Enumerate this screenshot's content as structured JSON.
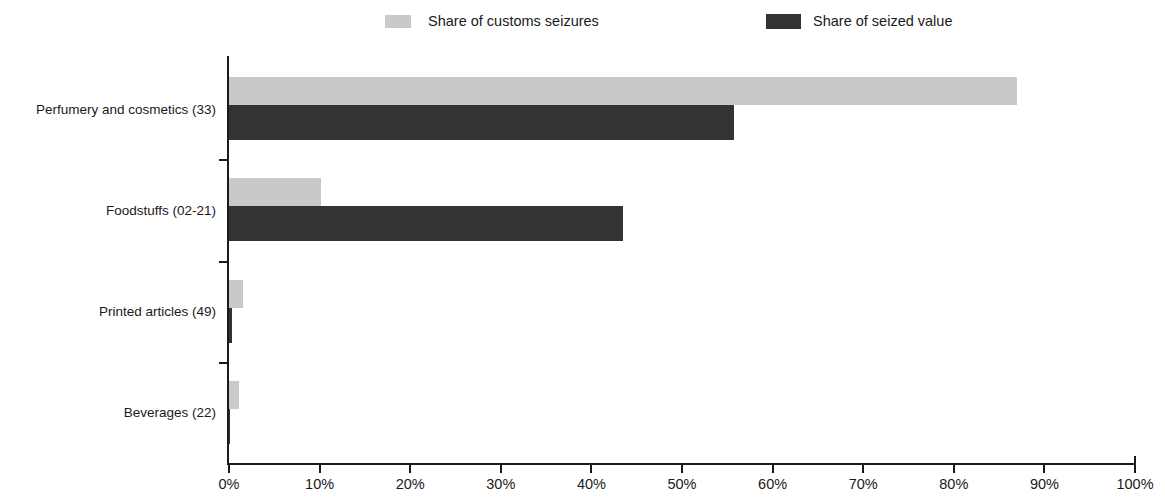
{
  "legend": {
    "position": "top",
    "items": [
      {
        "label": "Share of customs seizures",
        "color": "#c9c9c9",
        "swatch": "legend-swatch-light"
      },
      {
        "label": "Share of seized value",
        "color": "#333333",
        "swatch": "legend-swatch-dark"
      }
    ]
  },
  "axis": {
    "x_ticks": [
      "0%",
      "10%",
      "20%",
      "30%",
      "40%",
      "50%",
      "60%",
      "70%",
      "80%",
      "90%",
      "100%"
    ]
  },
  "chart_data": {
    "type": "bar",
    "orientation": "horizontal",
    "title": "",
    "subtitle": "",
    "xlabel": "",
    "ylabel": "",
    "xlim": [
      0,
      100
    ],
    "x_tick_values": [
      0,
      10,
      20,
      30,
      40,
      50,
      60,
      70,
      80,
      90,
      100
    ],
    "x_tick_labels": [
      "0%",
      "10%",
      "20%",
      "30%",
      "40%",
      "50%",
      "60%",
      "70%",
      "80%",
      "90%",
      "100%"
    ],
    "grid": false,
    "legend_position": "top",
    "categories": [
      "Perfumery and cosmetics (33)",
      "Foodstuffs (02-21)",
      "Printed articles (49)",
      "Beverages (22)"
    ],
    "series": [
      {
        "name": "Share of customs seizures",
        "color": "#c9c9c9",
        "values": [
          87.0,
          10.2,
          1.6,
          1.1
        ]
      },
      {
        "name": "Share of seized value",
        "color": "#333333",
        "values": [
          55.7,
          43.5,
          0.3,
          0.05
        ]
      }
    ]
  }
}
